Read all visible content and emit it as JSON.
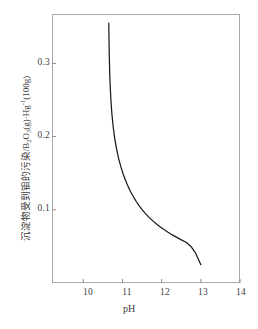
{
  "chart_data": {
    "type": "line",
    "title": "",
    "xlabel": "pH",
    "ylabel_cjk": "沉淀物受到钼的污染",
    "ylabel_sep": "/",
    "ylabel_unit_b": "B",
    "ylabel_unit_b_sub": "2",
    "ylabel_unit_o": "O",
    "ylabel_unit_o_sub": "3",
    "ylabel_unit_g": "(g)",
    "ylabel_dot": "·",
    "ylabel_hg": "Hg",
    "ylabel_hg_sup": "-1",
    "ylabel_100g": "(100g)",
    "ylabel_full": "沉淀物受到钼的污染/B2O3(g)·Hg-1(100g)",
    "xlim": [
      9.2,
      14.0
    ],
    "ylim": [
      0.0,
      0.3675
    ],
    "xticks": [
      10,
      11,
      12,
      13,
      14
    ],
    "xtick_labels": [
      "10",
      "11",
      "12",
      "13",
      "14"
    ],
    "yticks": [
      0.1,
      0.2,
      0.3
    ],
    "ytick_labels": [
      "0.1",
      "0.2",
      "0.3"
    ],
    "grid": false,
    "legend": null,
    "line_color": "#1a1a1a",
    "frame_color": "#a9a9a9",
    "series": [
      {
        "name": "contamination-vs-pH",
        "x": [
          10.65,
          10.655,
          10.662,
          10.672,
          10.686,
          10.705,
          10.73,
          10.762,
          10.8,
          10.845,
          10.896,
          10.952,
          11.012,
          11.076,
          11.142,
          11.211,
          11.282,
          11.356,
          11.432,
          11.511,
          11.593,
          11.678,
          11.767,
          11.86,
          11.957,
          12.058,
          12.163,
          12.272,
          12.385,
          12.502,
          12.623,
          12.748,
          12.874,
          13.0
        ],
        "y": [
          0.355,
          0.334,
          0.312,
          0.29,
          0.269,
          0.249,
          0.2305,
          0.2135,
          0.198,
          0.184,
          0.1714,
          0.16,
          0.1497,
          0.1404,
          0.132,
          0.1244,
          0.1174,
          0.111,
          0.1051,
          0.0996,
          0.0945,
          0.0897,
          0.0852,
          0.0809,
          0.0769,
          0.073,
          0.0693,
          0.0657,
          0.0623,
          0.0589,
          0.0556,
          0.05,
          0.04,
          0.025
        ]
      }
    ]
  }
}
